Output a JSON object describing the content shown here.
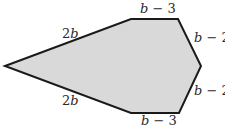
{
  "figure": {
    "type": "hexagon",
    "fill_color": "#d9d9d9",
    "stroke_color": "#1a1a1a",
    "sides": [
      {
        "id": "upper-left",
        "label_coef": "2",
        "label_var": "b",
        "label_rest": ""
      },
      {
        "id": "top",
        "label_coef": "",
        "label_var": "b",
        "label_rest": " − 3"
      },
      {
        "id": "upper-right",
        "label_coef": "",
        "label_var": "b",
        "label_rest": " − 2"
      },
      {
        "id": "lower-right",
        "label_coef": "",
        "label_var": "b",
        "label_rest": " − 2"
      },
      {
        "id": "bottom",
        "label_coef": "",
        "label_var": "b",
        "label_rest": " − 3"
      },
      {
        "id": "lower-left",
        "label_coef": "2",
        "label_var": "b",
        "label_rest": ""
      }
    ]
  }
}
